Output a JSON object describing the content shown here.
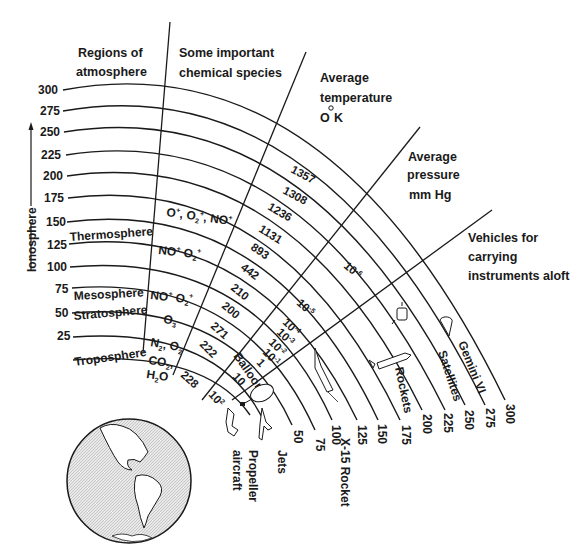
{
  "headers": {
    "regions": [
      "Regions of",
      "atmosphere"
    ],
    "chemical": [
      "Some important",
      "chemical species"
    ],
    "temperature": [
      "Average",
      "temperature",
      "O K"
    ],
    "pressure": [
      "Average",
      "pressure",
      "mm Hg"
    ],
    "vehicles": [
      "Vehicles for",
      "carrying",
      "instruments aloft"
    ]
  },
  "axis": {
    "ionosphere_label": "Ionosphere",
    "altitudes": [
      "300",
      "275",
      "250",
      "225",
      "200",
      "175",
      "150",
      "125",
      "100",
      "75",
      "50",
      "25"
    ],
    "bottom_altitudes": [
      "50",
      "75",
      "100",
      "125",
      "150",
      "175",
      "200",
      "225",
      "250",
      "275",
      "300"
    ]
  },
  "regions": [
    {
      "name": "Thermosphere"
    },
    {
      "name": "Mesosphere"
    },
    {
      "name": "Stratosphere"
    },
    {
      "name": "Troposphere"
    }
  ],
  "chemical_species": [
    {
      "label": "O+, O2+, NO+"
    },
    {
      "label": "NO+  O2+"
    },
    {
      "label": "NO+  O2+"
    },
    {
      "label": "O3"
    },
    {
      "label": "N2, O2"
    },
    {
      "label": "CO2, H2O"
    }
  ],
  "temperatures": [
    "1357",
    "1308",
    "1236",
    "1131",
    "893",
    "442",
    "210",
    "200",
    "271",
    "222",
    "228"
  ],
  "pressures": [
    {
      "base": "10",
      "exp": "-6"
    },
    {
      "base": "10",
      "exp": "-5"
    },
    {
      "base": "10",
      "exp": "-4"
    },
    {
      "base": "10",
      "exp": "-3"
    },
    {
      "base": "10",
      "exp": "-2"
    },
    {
      "base": "10",
      "exp": "-1"
    },
    {
      "base": "1",
      "exp": ""
    },
    {
      "base": "10",
      "exp": ""
    },
    {
      "base": "10",
      "exp": "2"
    }
  ],
  "vehicles": [
    {
      "name": "Propeller",
      "name2": "aircraft"
    },
    {
      "name": "Jets"
    },
    {
      "name": "Balloons"
    },
    {
      "name": "X-15 Rocket"
    },
    {
      "name": "Rockets"
    },
    {
      "name": "Satellites"
    },
    {
      "name": "Gemini VI"
    }
  ]
}
